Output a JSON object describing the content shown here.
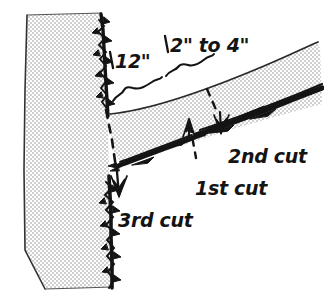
{
  "figure": {
    "background_color": "#ffffff",
    "ink_color": "#141414",
    "wood_fill_color": "#d9d9d9",
    "width": 324,
    "height": 302
  },
  "dimensions": [
    {
      "id": "distance-from-trunk",
      "label": "12\"",
      "brace": "left-brace"
    },
    {
      "id": "cut-spacing",
      "label": "2\" to 4\"",
      "brace": "right-brace"
    }
  ],
  "cuts": [
    {
      "id": "first-cut",
      "label": "1st cut",
      "direction": "undercut-upward",
      "arrow": "up"
    },
    {
      "id": "second-cut",
      "label": "2nd cut",
      "direction": "topcut-downward",
      "arrow": "down"
    },
    {
      "id": "third-cut",
      "label": "3rd cut",
      "direction": "collar-cut-downward",
      "arrow": "down"
    }
  ],
  "parts": [
    {
      "id": "trunk",
      "name": "tree trunk"
    },
    {
      "id": "branch",
      "name": "tree branch"
    }
  ]
}
